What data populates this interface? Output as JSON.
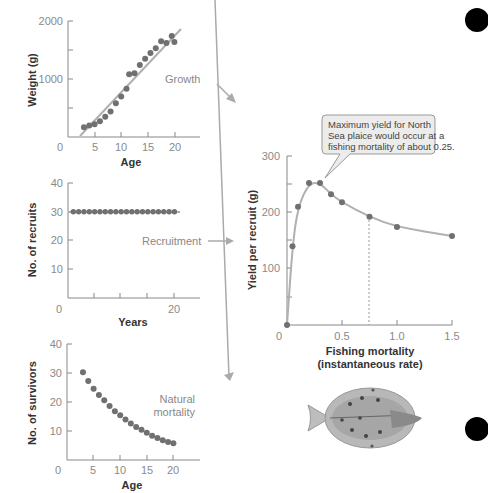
{
  "labels": {
    "growth_note": "Growth",
    "recruitment_note": "Recruitment",
    "mortality_note_1": "Natural",
    "mortality_note_2": "mortality",
    "callout_1": "Maximum yield for North",
    "callout_2": "Sea plaice would occur at a",
    "callout_3": "fishing mortality of about 0.25."
  },
  "chart_data": [
    {
      "type": "scatter",
      "title": "Growth",
      "xlabel": "Age",
      "ylabel": "Weight (g)",
      "xticks": [
        "0",
        "5",
        "10",
        "15",
        "20"
      ],
      "yticks": [
        "1000",
        "2000"
      ],
      "xlim": [
        0,
        25
      ],
      "ylim": [
        0,
        2000
      ],
      "x": [
        3,
        4,
        5,
        6,
        7,
        8,
        9,
        10,
        11,
        11.5,
        12.5,
        13.5,
        14.5,
        15.5,
        16.5,
        17.5,
        18.5,
        19.5,
        20
      ],
      "y": [
        170,
        200,
        220,
        270,
        350,
        440,
        580,
        700,
        830,
        1080,
        1100,
        1240,
        1350,
        1450,
        1530,
        1650,
        1620,
        1740,
        1640
      ],
      "trend_line": {
        "x": [
          3,
          21
        ],
        "y": [
          20,
          1850
        ]
      }
    },
    {
      "type": "scatter",
      "title": "Recruitment",
      "xlabel": "Years",
      "ylabel": "No. of recruits",
      "xticks": [
        "0",
        "20"
      ],
      "yticks": [
        "10",
        "20",
        "30",
        "40"
      ],
      "xlim": [
        0,
        25
      ],
      "ylim": [
        0,
        40
      ],
      "x": [
        1,
        2,
        3,
        4,
        5,
        6,
        7,
        8,
        9,
        10,
        11,
        12,
        13,
        14,
        15,
        16,
        17,
        18,
        19,
        20
      ],
      "y": [
        30,
        30,
        30,
        30,
        30,
        30,
        30,
        30,
        30,
        30,
        30,
        30,
        30,
        30,
        30,
        30,
        30,
        30,
        30,
        30
      ]
    },
    {
      "type": "scatter",
      "title": "Natural mortality",
      "xlabel": "Age",
      "ylabel": "No. of survivors",
      "xticks": [
        "0",
        "5",
        "10",
        "15",
        "20"
      ],
      "yticks": [
        "10",
        "20",
        "30",
        "40"
      ],
      "xlim": [
        0,
        25
      ],
      "ylim": [
        0,
        40
      ],
      "x": [
        3,
        4,
        5,
        6,
        7,
        8,
        9,
        10,
        11,
        12,
        13,
        14,
        15,
        16,
        17,
        18,
        19,
        20
      ],
      "y": [
        30.3,
        27.2,
        24.6,
        22.4,
        20.6,
        18.6,
        16.8,
        15.4,
        14.0,
        12.6,
        11.4,
        10.4,
        9.4,
        8.4,
        7.6,
        6.8,
        6.2,
        5.8
      ]
    },
    {
      "type": "line",
      "title": "Yield per recruit",
      "xlabel": "Fishing mortality (instantaneous rate)",
      "ylabel": "Yield per recruit (g)",
      "xticks": [
        "0",
        "0.5",
        "1.0",
        "1.5"
      ],
      "yticks": [
        "100",
        "200",
        "300"
      ],
      "xlim": [
        0,
        1.5
      ],
      "ylim": [
        0,
        300
      ],
      "x": [
        0,
        0.05,
        0.1,
        0.2,
        0.3,
        0.4,
        0.5,
        0.75,
        1.0,
        1.5
      ],
      "y": [
        0,
        140,
        210,
        252,
        252,
        232,
        218,
        192,
        174,
        158
      ],
      "annotation": {
        "x": 0.25,
        "text": "Maximum yield for North Sea plaice would occur at a fishing mortality of about 0.25."
      },
      "dashed_reference_x": 0.75
    }
  ]
}
